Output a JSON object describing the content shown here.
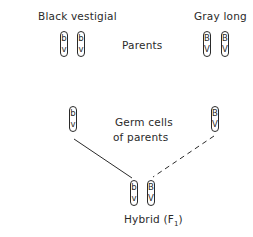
{
  "parents": {
    "left_label": "Black vestigial",
    "right_label": "Gray long",
    "center_label": "Parents",
    "left_chromosomes": [
      {
        "top": "b",
        "bottom": "v"
      },
      {
        "top": "b",
        "bottom": "v"
      }
    ],
    "right_chromosomes": [
      {
        "top": "B",
        "bottom": "V"
      },
      {
        "top": "B",
        "bottom": "V"
      }
    ]
  },
  "germ_cells": {
    "label_line1": "Germ cells",
    "label_line2": "of parents",
    "left_chromosome": {
      "top": "b",
      "bottom": "v"
    },
    "right_chromosome": {
      "top": "B",
      "bottom": "V"
    }
  },
  "hybrid": {
    "label": "Hybrid (F",
    "subscript": "1",
    "label_end": ")",
    "chromosomes": [
      {
        "top": "b",
        "bottom": "v"
      },
      {
        "top": "B",
        "bottom": "V"
      }
    ]
  },
  "connectors": {
    "left_style": "solid",
    "right_style": "dashed",
    "color": "#2a2a2a"
  }
}
